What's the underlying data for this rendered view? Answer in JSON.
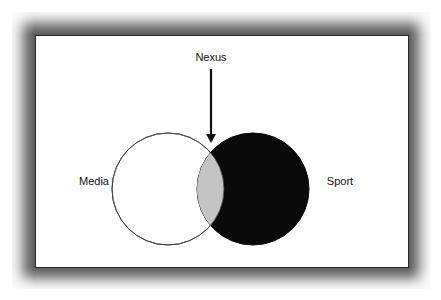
{
  "diagram": {
    "type": "venn",
    "arrow_label": "Nexus",
    "sets": [
      {
        "name": "Media",
        "fill": "#ffffff",
        "stroke": "#333333"
      },
      {
        "name": "Sport",
        "fill": "#0a0a0a",
        "stroke": "#0a0a0a"
      }
    ],
    "intersection": {
      "name": "Nexus",
      "fill": "#c4c4c4"
    }
  }
}
